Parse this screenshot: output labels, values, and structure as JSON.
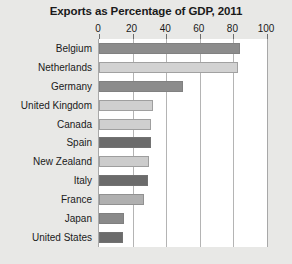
{
  "chart_data": {
    "type": "bar",
    "orientation": "horizontal",
    "title": "Exports as Percentage of GDP, 2011",
    "xlabel": "",
    "ylabel": "",
    "xlim": [
      0,
      100
    ],
    "xticks": [
      0,
      20,
      40,
      60,
      80,
      100
    ],
    "xtick_labels": [
      "0",
      "20",
      "40",
      "60",
      "80",
      "100"
    ],
    "grid": true,
    "legend": "none",
    "categories": [
      "Belgium",
      "Netherlands",
      "Germany",
      "United Kingdom",
      "Canada",
      "Spain",
      "New Zealand",
      "Italy",
      "France",
      "Japan",
      "United States"
    ],
    "values": [
      84,
      83,
      50,
      32,
      31,
      31,
      30,
      29,
      27,
      15,
      14
    ],
    "bar_colors": [
      "#8c8c8c",
      "#d2d2d2",
      "#8c8c8c",
      "#cfcfcf",
      "#cfcfcf",
      "#6b6b6b",
      "#cccccc",
      "#6b6b6b",
      "#b0b0b0",
      "#8a8a8a",
      "#6b6b6b"
    ]
  },
  "style": {
    "page_background": "#e8e8e6",
    "plot_background": "#ffffff",
    "gridline_color": "#b4b4b4",
    "axis_color": "#a8a8a8",
    "text_color": "#1a1a1a"
  }
}
